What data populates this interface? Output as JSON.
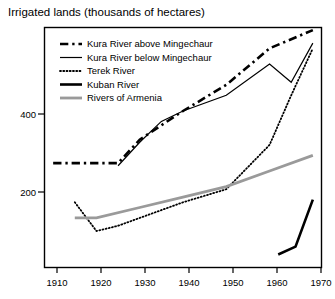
{
  "chart_data": {
    "type": "line",
    "title": "Irrigated lands (thousands of hectares)",
    "xlabel": "",
    "ylabel": "",
    "xlim": [
      1908,
      1972
    ],
    "ylim": [
      0,
      460
    ],
    "grid": false,
    "legend_position": "top-left inside plot",
    "x_ticks": [
      "1910",
      "1920",
      "1930",
      "1940",
      "1950",
      "1960",
      "1970"
    ],
    "x_tick_values": [
      1910,
      1920,
      1930,
      1940,
      1950,
      1960,
      1970
    ],
    "y_ticks": [
      "200",
      "400"
    ],
    "y_tick_values": [
      200,
      400
    ],
    "series": [
      {
        "name": "Kura River above Mingechaur",
        "style": "dash-dot",
        "color": "#000000",
        "width": 2.6,
        "x": [
          1910,
          1920,
          1925,
          1930,
          1940,
          1950,
          1960,
          1970
        ],
        "values": [
          200,
          200,
          200,
          245,
          300,
          350,
          420,
          455
        ]
      },
      {
        "name": "Kura River below Mingechaur",
        "style": "solid",
        "color": "#000000",
        "width": 1.2,
        "x": [
          1925,
          1930,
          1935,
          1940,
          1950,
          1960,
          1965,
          1970
        ],
        "values": [
          195,
          240,
          280,
          300,
          330,
          390,
          355,
          430
        ]
      },
      {
        "name": "Terek River",
        "style": "dotted",
        "color": "#000000",
        "width": 1.8,
        "x": [
          1915,
          1920,
          1925,
          1930,
          1940,
          1950,
          1960,
          1965,
          1970
        ],
        "values": [
          125,
          70,
          80,
          95,
          125,
          150,
          235,
          330,
          420
        ]
      },
      {
        "name": "Kuban River",
        "style": "solid-thick",
        "color": "#000000",
        "width": 2.6,
        "x": [
          1962,
          1966,
          1970
        ],
        "values": [
          25,
          40,
          130
        ]
      },
      {
        "name": "Rivers of Armenia",
        "style": "solid-gray",
        "color": "#9a9a9a",
        "width": 2.8,
        "x": [
          1915,
          1920,
          1930,
          1940,
          1950,
          1960,
          1970
        ],
        "values": [
          95,
          95,
          115,
          135,
          155,
          185,
          215
        ]
      }
    ]
  },
  "legend": {
    "items": [
      {
        "label": "Kura River above Mingechaur",
        "swatch": "dash-dot"
      },
      {
        "label": "Kura River below Mingechaur",
        "swatch": "solid"
      },
      {
        "label": "Terek River",
        "swatch": "dotted"
      },
      {
        "label": "Kuban River",
        "swatch": "solid-thick"
      },
      {
        "label": "Rivers of Armenia",
        "swatch": "solid-gray"
      }
    ]
  },
  "colors": {
    "frame": "#000000",
    "ink": "#000000",
    "armenia_gray": "#9a9a9a",
    "background": "#ffffff"
  }
}
